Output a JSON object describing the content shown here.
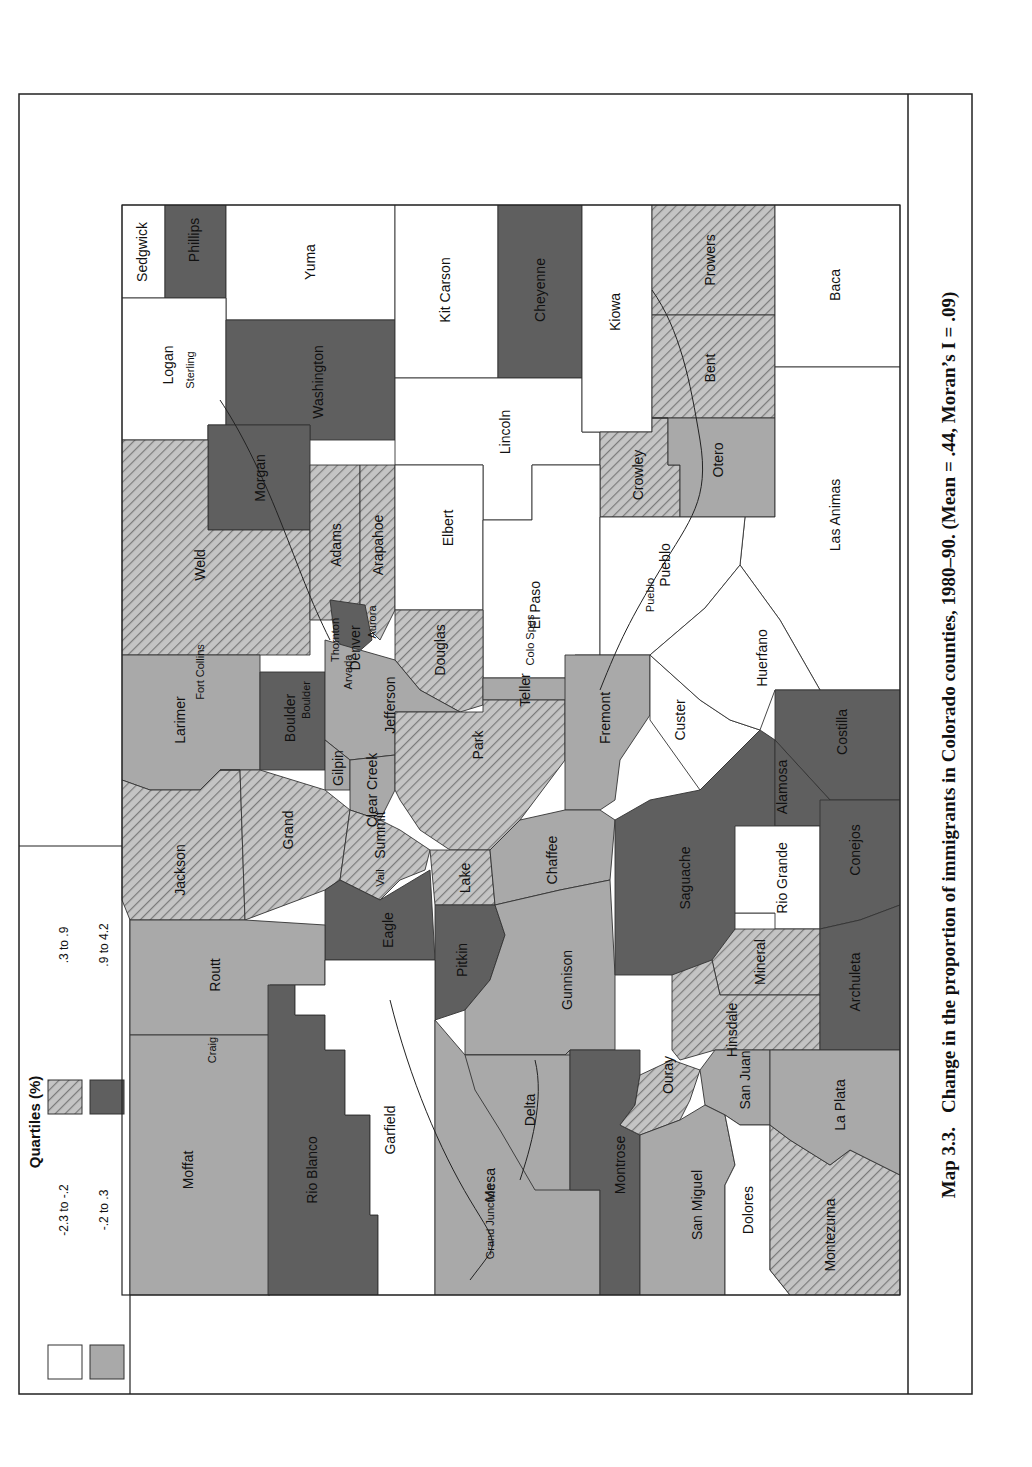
{
  "caption": {
    "number": "Map 3.3.",
    "text": "Change in the proportion of immigrants in Colorado counties, 1980–90. (Mean = .44, Moran’s I = .09)"
  },
  "legend": {
    "title": "Quartiles (%)",
    "classes": [
      {
        "id": "q1",
        "label": "-2.3 to -.2",
        "fill": "#ffffff",
        "pattern": "none"
      },
      {
        "id": "q2",
        "label": "-.2 to .3",
        "fill": "#a9a9a9",
        "pattern": "none"
      },
      {
        "id": "q3",
        "label": ".3 to .9",
        "fill": "#b4b4b4",
        "pattern": "hatch"
      },
      {
        "id": "q4",
        "label": ".9 to 4.2",
        "fill": "#5f5f5f",
        "pattern": "none"
      }
    ]
  },
  "counties": [
    {
      "name": "Sedgwick",
      "class": "q1"
    },
    {
      "name": "Phillips",
      "class": "q4"
    },
    {
      "name": "Logan",
      "class": "q1"
    },
    {
      "name": "Yuma",
      "class": "q1"
    },
    {
      "name": "Washington",
      "class": "q4"
    },
    {
      "name": "Morgan",
      "class": "q4"
    },
    {
      "name": "Weld",
      "class": "q3"
    },
    {
      "name": "Larimer",
      "class": "q2"
    },
    {
      "name": "Jackson",
      "class": "q3"
    },
    {
      "name": "Moffat",
      "class": "q2"
    },
    {
      "name": "Routt",
      "class": "q2"
    },
    {
      "name": "Grand",
      "class": "q3"
    },
    {
      "name": "Boulder",
      "class": "q4"
    },
    {
      "name": "Gilpin",
      "class": "q2"
    },
    {
      "name": "Clear Creek",
      "class": "q2"
    },
    {
      "name": "Jefferson",
      "class": "q2"
    },
    {
      "name": "Adams",
      "class": "q3"
    },
    {
      "name": "Arapahoe",
      "class": "q3"
    },
    {
      "name": "Denver",
      "class": "q4"
    },
    {
      "name": "Douglas",
      "class": "q3"
    },
    {
      "name": "Elbert",
      "class": "q1"
    },
    {
      "name": "Kit Carson",
      "class": "q1"
    },
    {
      "name": "Lincoln",
      "class": "q1"
    },
    {
      "name": "Cheyenne",
      "class": "q4"
    },
    {
      "name": "Kiowa",
      "class": "q1"
    },
    {
      "name": "El Paso",
      "class": "q1"
    },
    {
      "name": "Teller",
      "class": "q2"
    },
    {
      "name": "Park",
      "class": "q3"
    },
    {
      "name": "Summit",
      "class": "q3"
    },
    {
      "name": "Eagle",
      "class": "q4"
    },
    {
      "name": "Rio Blanco",
      "class": "q4"
    },
    {
      "name": "Garfield",
      "class": "q1"
    },
    {
      "name": "Pitkin",
      "class": "q4"
    },
    {
      "name": "Lake",
      "class": "q3"
    },
    {
      "name": "Chaffee",
      "class": "q2"
    },
    {
      "name": "Fremont",
      "class": "q2"
    },
    {
      "name": "Pueblo",
      "class": "q1"
    },
    {
      "name": "Crowley",
      "class": "q3"
    },
    {
      "name": "Otero",
      "class": "q2"
    },
    {
      "name": "Bent",
      "class": "q3"
    },
    {
      "name": "Prowers",
      "class": "q3"
    },
    {
      "name": "Baca",
      "class": "q1"
    },
    {
      "name": "Las Animas",
      "class": "q1"
    },
    {
      "name": "Huerfano",
      "class": "q1"
    },
    {
      "name": "Custer",
      "class": "q1"
    },
    {
      "name": "Costilla",
      "class": "q4"
    },
    {
      "name": "Alamosa",
      "class": "q4"
    },
    {
      "name": "Conejos",
      "class": "q4"
    },
    {
      "name": "Saguache",
      "class": "q4"
    },
    {
      "name": "Rio Grande",
      "class": "q1"
    },
    {
      "name": "Mineral",
      "class": "q3"
    },
    {
      "name": "Archuleta",
      "class": "q4"
    },
    {
      "name": "Hinsdale",
      "class": "q3"
    },
    {
      "name": "Gunnison",
      "class": "q2"
    },
    {
      "name": "Delta",
      "class": "q2"
    },
    {
      "name": "Mesa",
      "class": "q2"
    },
    {
      "name": "Montrose",
      "class": "q4"
    },
    {
      "name": "Ouray",
      "class": "q3"
    },
    {
      "name": "San Juan",
      "class": "q2"
    },
    {
      "name": "San Miguel",
      "class": "q2"
    },
    {
      "name": "Dolores",
      "class": "q1"
    },
    {
      "name": "Montezuma",
      "class": "q3"
    },
    {
      "name": "La Plata",
      "class": "q2"
    }
  ],
  "cities": [
    "Sterling",
    "Fort Collins",
    "Boulder",
    "Thornton",
    "Arvada",
    "Aurora",
    "Colo Spgs",
    "Pueblo",
    "Vail",
    "Craig",
    "Grand Junction"
  ]
}
